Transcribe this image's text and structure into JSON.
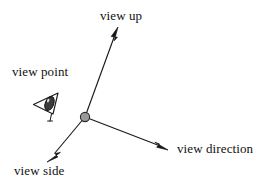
{
  "diagram": {
    "background_color": "#ffffff",
    "stroke_color": "#1a1a1a",
    "node_fill_color": "#9a9a9a",
    "labels": {
      "view_up": "view up",
      "view_point": "view point",
      "view_side": "view side",
      "view_direction": "view direction"
    },
    "origin": {
      "x": 85,
      "y": 117,
      "radius": 5
    },
    "axes": [
      {
        "name": "view up",
        "from": {
          "x": 85,
          "y": 117
        },
        "to": {
          "x": 118,
          "y": 27
        },
        "arrowhead": "filled-triangle"
      },
      {
        "name": "view direction",
        "from": {
          "x": 85,
          "y": 117
        },
        "to": {
          "x": 168,
          "y": 150
        },
        "arrowhead": "filled-triangle"
      },
      {
        "name": "view side",
        "from": {
          "x": 85,
          "y": 117
        },
        "to": {
          "x": 47,
          "y": 162
        },
        "arrowhead": "filled-triangle"
      }
    ],
    "eye_icon": {
      "name": "eye-viewing-frustum-icon",
      "x": 32,
      "y": 90,
      "width": 29,
      "height": 30
    }
  }
}
